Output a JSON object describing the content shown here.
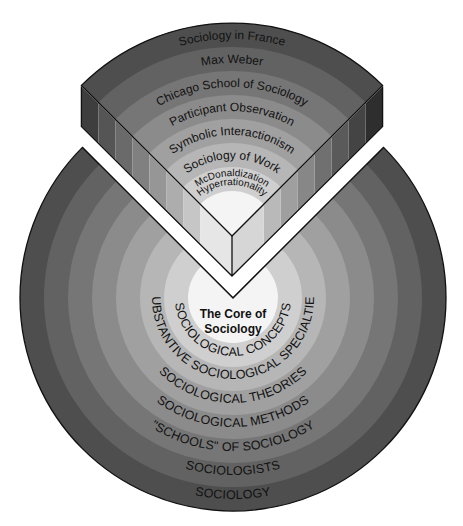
{
  "diagram": {
    "core": {
      "line1": "The Core of",
      "line2": "Sociology"
    },
    "disk_rings": [
      "SOCIOLOGICAL CONCEPTS",
      "SUBSTANTIVE SOCIOLOGICAL SPECIALTIES",
      "SOCIOLOGICAL THEORIES",
      "SOCIOLOGICAL METHODS",
      "\"SCHOOLS\" OF SOCIOLOGY",
      "SOCIOLOGISTS",
      "SOCIOLOGY"
    ],
    "wedge_rings": [
      "McDonaldization",
      "Hyperrationality",
      "Sociology of Work",
      "Symbolic Interactionism",
      "Participant Observation",
      "Chicago School of Sociology",
      "Max Weber",
      "Sociology in France"
    ],
    "ring_colors": [
      "#cfcfcf",
      "#b6b6b6",
      "#a0a0a0",
      "#8b8b8b",
      "#767676",
      "#626262",
      "#4e4e4e"
    ],
    "core_color": "#f4f4f4"
  }
}
